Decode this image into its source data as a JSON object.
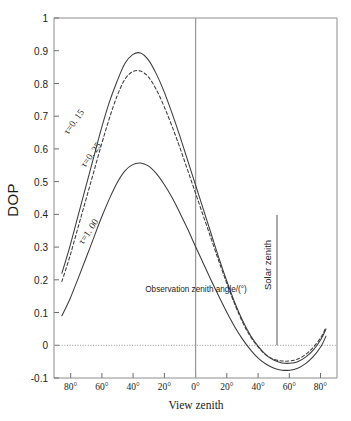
{
  "figure": {
    "background_color": "#ffffff",
    "line_color": "#3a3a3a",
    "axis_color": "#8d8d8d"
  },
  "axes": {
    "y_label": "DOP",
    "x_label": "View zenith",
    "y_ticks": [
      "1",
      "0.9",
      "0.8",
      "0.7",
      "0.6",
      "0.5",
      "0.4",
      "0.3",
      "0.2",
      "0.1",
      "0",
      "-0.1"
    ],
    "x_ticks": [
      "80°",
      "60°",
      "40°",
      "20°",
      "0°",
      "20°",
      "40°",
      "60°",
      "80°"
    ]
  },
  "annotations": {
    "observation_axis": "Observation zenith  angle/(°)",
    "solar_zenith": "Solar zenith",
    "curve_labels": [
      "τ=0. 15",
      "τ=0. 25",
      "τ=1. 00"
    ]
  },
  "chart_data": {
    "type": "line",
    "title": "",
    "subtitle": "",
    "xlabel": "View zenith",
    "ylabel": "DOP",
    "xlim": [
      -90,
      90
    ],
    "ylim": [
      -0.1,
      1.0
    ],
    "xtick_values": [
      -80,
      -60,
      -40,
      -20,
      0,
      20,
      40,
      60,
      80
    ],
    "xtick_labels": [
      "80°",
      "60°",
      "40°",
      "20°",
      "0°",
      "20°",
      "40°",
      "60°",
      "80°"
    ],
    "ytick_values": [
      1,
      0.9,
      0.8,
      0.7,
      0.6,
      0.5,
      0.4,
      0.3,
      0.2,
      0.1,
      0,
      -0.1
    ],
    "ytick_labels": [
      "1",
      "0.9",
      "0.8",
      "0.7",
      "0.6",
      "0.5",
      "0.4",
      "0.3",
      "0.2",
      "0.1",
      "0",
      "-0.1"
    ],
    "grid": false,
    "legend_position": "inline-curve-labels",
    "zero_reference_line": 0,
    "vertical_markers": [
      {
        "name": "observation-zenith-axis",
        "x": 0,
        "label": "Observation zenith  angle/(°)",
        "y_top": 1.0,
        "y_bottom": -0.1
      },
      {
        "name": "solar-zenith-marker",
        "x": 52,
        "label": "Solar zenith",
        "y_top": 0.4,
        "y_bottom": 0.0
      }
    ],
    "x": [
      -85,
      -80,
      -75,
      -70,
      -65,
      -60,
      -55,
      -50,
      -45,
      -40,
      -35,
      -30,
      -25,
      -20,
      -15,
      -10,
      -5,
      0,
      5,
      10,
      15,
      20,
      25,
      30,
      35,
      40,
      45,
      50,
      55,
      60,
      65,
      70,
      75,
      80,
      83
    ],
    "series": [
      {
        "name": "τ=0. 15",
        "style": "solid",
        "peak": {
          "x": -43,
          "y": 0.895
        },
        "minimum": {
          "x": 57,
          "y": -0.055
        },
        "values": [
          0.22,
          0.3,
          0.39,
          0.48,
          0.57,
          0.66,
          0.74,
          0.805,
          0.86,
          0.888,
          0.893,
          0.872,
          0.83,
          0.775,
          0.71,
          0.64,
          0.565,
          0.49,
          0.415,
          0.34,
          0.265,
          0.195,
          0.13,
          0.075,
          0.03,
          -0.004,
          -0.03,
          -0.046,
          -0.054,
          -0.055,
          -0.05,
          -0.036,
          -0.014,
          0.02,
          0.05
        ]
      },
      {
        "name": "τ=0. 25",
        "style": "dashed",
        "peak": {
          "x": -42,
          "y": 0.84
        },
        "minimum": {
          "x": 57,
          "y": -0.048
        },
        "values": [
          0.195,
          0.27,
          0.355,
          0.44,
          0.525,
          0.61,
          0.69,
          0.76,
          0.812,
          0.836,
          0.838,
          0.82,
          0.782,
          0.73,
          0.67,
          0.605,
          0.535,
          0.465,
          0.395,
          0.325,
          0.255,
          0.188,
          0.125,
          0.07,
          0.026,
          -0.006,
          -0.03,
          -0.043,
          -0.048,
          -0.048,
          -0.042,
          -0.028,
          -0.006,
          0.026,
          0.055
        ]
      },
      {
        "name": "τ=1. 00",
        "style": "solid",
        "peak": {
          "x": -33,
          "y": 0.558
        },
        "minimum": {
          "x": 57,
          "y": -0.076
        },
        "values": [
          0.09,
          0.14,
          0.2,
          0.262,
          0.325,
          0.388,
          0.445,
          0.495,
          0.532,
          0.552,
          0.557,
          0.548,
          0.525,
          0.492,
          0.452,
          0.405,
          0.355,
          0.302,
          0.25,
          0.198,
          0.148,
          0.1,
          0.056,
          0.018,
          -0.014,
          -0.04,
          -0.058,
          -0.07,
          -0.076,
          -0.076,
          -0.07,
          -0.056,
          -0.034,
          -0.002,
          0.028
        ]
      }
    ]
  }
}
